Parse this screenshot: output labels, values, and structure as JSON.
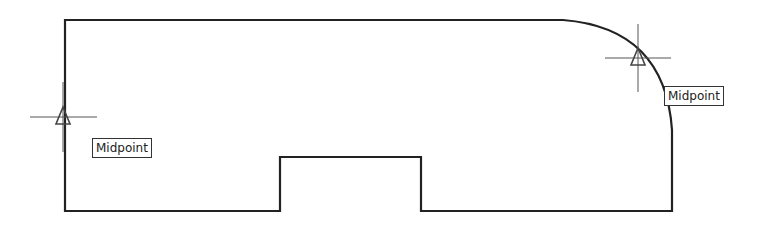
{
  "drawing": {
    "outline_color": "#222222",
    "crosshair_color": "#555555",
    "marker_color": "#444444",
    "snap_markers": [
      {
        "name": "left-edge-midpoint",
        "label": "Midpoint",
        "x": 63,
        "y": 117,
        "label_x": 92,
        "label_y": 138
      },
      {
        "name": "arc-midpoint",
        "label": "Midpoint",
        "x": 638,
        "y": 58,
        "label_x": 664,
        "label_y": 86
      }
    ]
  }
}
